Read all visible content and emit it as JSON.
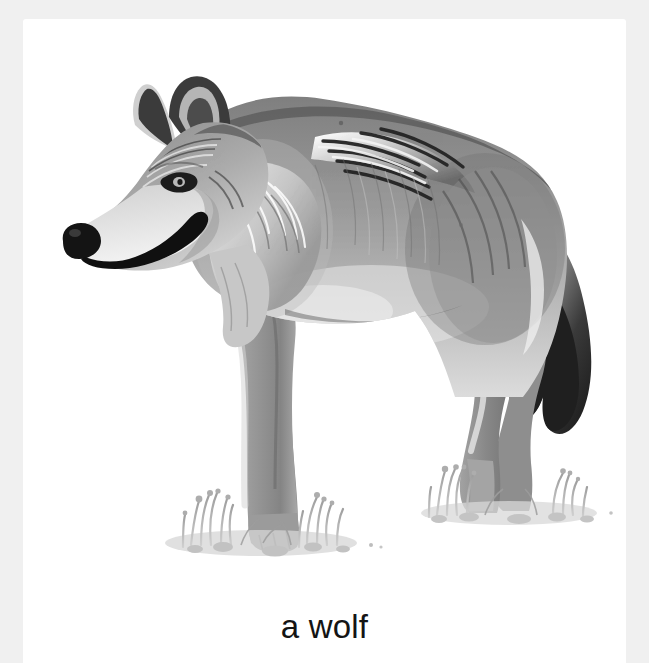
{
  "card": {
    "type": "picture-flashcard",
    "caption": "a wolf",
    "subject": "wolf",
    "illustration_style": "grayscale pencil illustration",
    "background_color": "#ffffff",
    "frame_color": "#f0f0f0",
    "caption_color": "#141414"
  },
  "illustration": {
    "name": "wolf-illustration",
    "alt": "a wolf",
    "description": "Grayscale drawing of a wolf standing in profile facing left on small tufts of grass",
    "animal": {
      "species": "wolf",
      "pose": "standing in profile, facing left",
      "parts": [
        "ears",
        "eye",
        "muzzle",
        "nose",
        "mouth",
        "neck-ruff",
        "back",
        "mane",
        "chest",
        "front-legs",
        "hind-legs",
        "paws",
        "tail"
      ],
      "colors": {
        "body_light": "#c9c9c9",
        "body_mid": "#a0a0a0",
        "body_dark": "#6e6e6e",
        "shadow": "#4a4a4a",
        "nose": "#1b1b1b",
        "tail_tip": "#1e1e1e",
        "highlight": "#ededed"
      }
    },
    "ground": {
      "name": "grass-tufts",
      "count": 2,
      "color": "#b4b4b4",
      "positions": [
        "front-left",
        "rear-right"
      ]
    }
  }
}
